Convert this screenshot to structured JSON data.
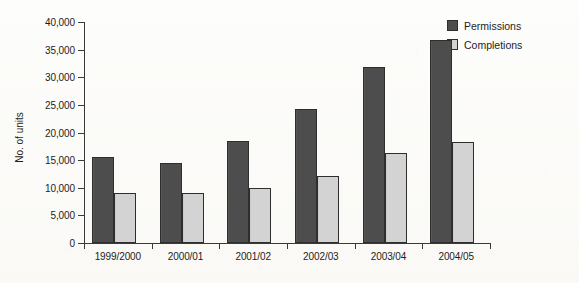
{
  "chart_data": {
    "type": "bar",
    "title": "",
    "xlabel": "",
    "ylabel": "No. of units",
    "ylim": [
      0,
      40000
    ],
    "ytick_labels": [
      "0",
      "5,000",
      "10,000",
      "15,000",
      "20,000",
      "25,000",
      "30,000",
      "35,000",
      "40,000"
    ],
    "ytick_values": [
      0,
      5000,
      10000,
      15000,
      20000,
      25000,
      30000,
      35000,
      40000
    ],
    "categories": [
      "1999/2000",
      "2000/01",
      "2001/02",
      "2002/03",
      "2003/04",
      "2004/05"
    ],
    "grid": false,
    "legend_position": "top-right",
    "series": [
      {
        "name": "Permissions",
        "color": "#4d4d4d",
        "values": [
          15500,
          14500,
          18400,
          24200,
          31800,
          36700
        ]
      },
      {
        "name": "Completions",
        "color": "#d3d3d3",
        "values": [
          9000,
          9000,
          10000,
          12100,
          16300,
          18300
        ]
      }
    ]
  }
}
